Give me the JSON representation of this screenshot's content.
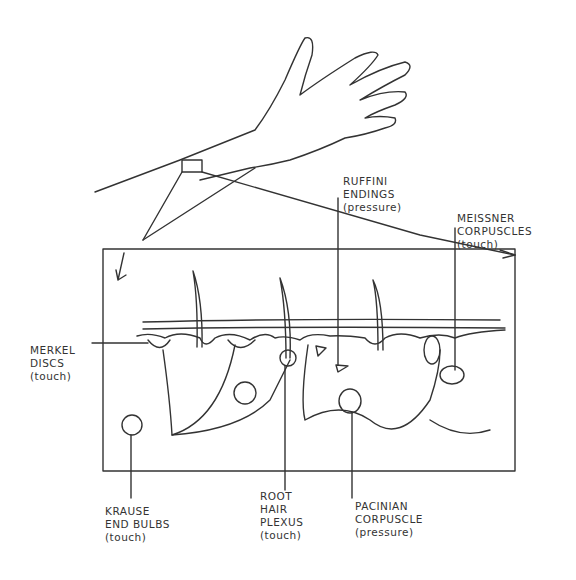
{
  "diagram": {
    "type": "anatomical-illustration",
    "colors": {
      "ink": "#333333",
      "background": "#ffffff"
    },
    "labels": [
      {
        "id": "merkel",
        "lines": [
          "MERKEL",
          "DISCS",
          "(touch)"
        ]
      },
      {
        "id": "ruffini",
        "lines": [
          "RUFFINI",
          "ENDINGS",
          "(pressure)"
        ]
      },
      {
        "id": "meissner",
        "lines": [
          "MEISSNER",
          "CORPUSCLES",
          "(touch)"
        ]
      },
      {
        "id": "krause",
        "lines": [
          "KRAUSE",
          "END BULBS",
          "(touch)"
        ]
      },
      {
        "id": "root-hair",
        "lines": [
          "ROOT",
          "HAIR",
          "PLEXUS",
          "(touch)"
        ]
      },
      {
        "id": "pacinian",
        "lines": [
          "PACINIAN",
          "CORPUSCLE",
          "(pressure)"
        ]
      }
    ]
  }
}
